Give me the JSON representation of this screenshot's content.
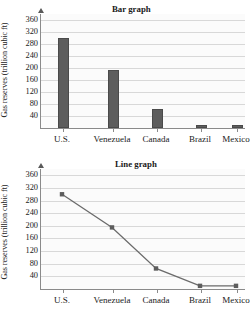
{
  "chart_data": [
    {
      "type": "bar",
      "title": "Bar graph",
      "xlabel": "",
      "ylabel": "Gas reserves (trillion cubic ft)",
      "categories": [
        "U.S.",
        "Venezuela",
        "Canada",
        "Brazil",
        "Mexico"
      ],
      "values": [
        300,
        195,
        65,
        10,
        10
      ],
      "ylim": [
        0,
        380
      ],
      "yticks": [
        40,
        80,
        120,
        160,
        200,
        240,
        280,
        320,
        360
      ],
      "grid": true,
      "legend": "none",
      "bar_color": "#5d5d5d"
    },
    {
      "type": "line",
      "title": "Line graph",
      "xlabel": "",
      "ylabel": "Gas reserves (trillion cubic ft)",
      "categories": [
        "U.S.",
        "Venezuela",
        "Canada",
        "Brazil",
        "Mexico"
      ],
      "values": [
        300,
        195,
        65,
        10,
        10
      ],
      "ylim": [
        0,
        380
      ],
      "yticks": [
        40,
        80,
        120,
        160,
        200,
        240,
        280,
        320,
        360
      ],
      "grid": true,
      "legend": "none",
      "line_color": "#6b6b6b",
      "marker_color": "#5d5d5d"
    }
  ]
}
